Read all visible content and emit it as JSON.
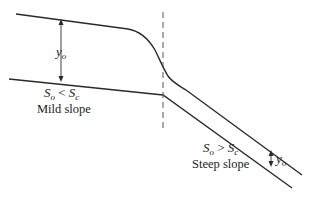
{
  "diagram": {
    "type": "open-channel flow profile: mild slope to steep slope transition",
    "colors": {
      "line": "#2a2a2a",
      "dashed": "#555555",
      "background": "#ffffff"
    },
    "labels": {
      "depth_left": {
        "main": "y",
        "sub": "o"
      },
      "mild_condition": {
        "a": "S",
        "a_sub": "o",
        "op": " < ",
        "b": "S",
        "b_sub": "c"
      },
      "mild_name": "Mild slope",
      "steep_condition": {
        "a": "S",
        "a_sub": "o",
        "op": " > ",
        "b": "S",
        "b_sub": "c"
      },
      "steep_name": "Steep slope",
      "depth_right": {
        "main": "y",
        "sub": "o"
      }
    },
    "elements": [
      "water-surface (normal depth on mild slope, drawdown curve, normal depth on steep slope)",
      "channel-bed (mild slope then break to steep slope)",
      "dashed vertical line at slope break",
      "depth arrow y_o on mild reach",
      "depth arrow y_o on steep reach"
    ]
  }
}
